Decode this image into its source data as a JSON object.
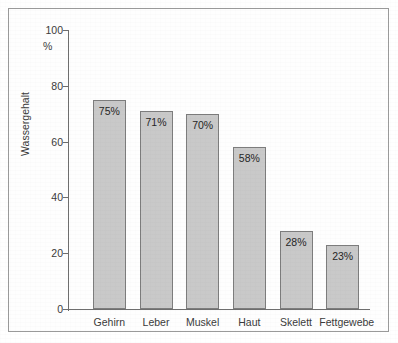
{
  "figure": {
    "background_color": "#ffffff",
    "frame_color": "#9a9a9a"
  },
  "chart_data": {
    "type": "bar",
    "title": "",
    "subtitle": "",
    "xlabel": "",
    "ylabel": "Wassergehalt",
    "unit_label": "%",
    "categories": [
      "Gehirn",
      "Leber",
      "Muskel",
      "Haut",
      "Skelett",
      "Fettgewebe"
    ],
    "values": [
      75,
      71,
      70,
      58,
      28,
      23
    ],
    "data_labels": [
      "75%",
      "71%",
      "70%",
      "58%",
      "28%",
      "23%"
    ],
    "ylim": [
      0,
      100
    ],
    "ytick_labels": [
      "100",
      "80",
      "60",
      "40",
      "20",
      "0"
    ],
    "ytick_values": [
      100,
      80,
      60,
      40,
      20,
      0
    ],
    "grid": false,
    "legend": null,
    "bar_fill_color": "#c9c9c9",
    "bar_edge_color": "#7d7d7d",
    "axis_color": "#6e6e6e",
    "text_color": "#3b3b3b"
  }
}
